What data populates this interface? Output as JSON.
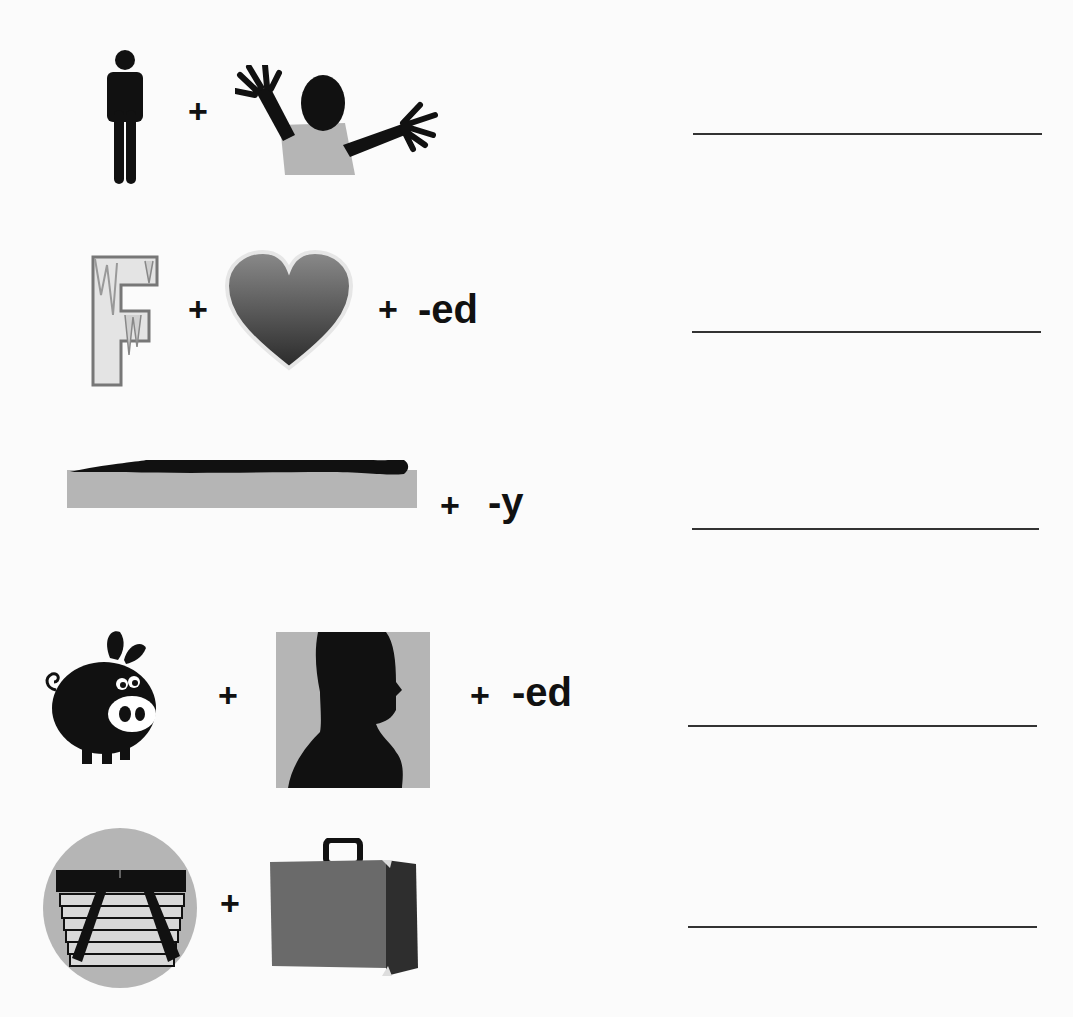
{
  "worksheet": {
    "rows": [
      {
        "pictures": [
          "man-icon",
          "child-waving-icon"
        ],
        "operators": [
          "+"
        ],
        "suffix": "",
        "answer": ""
      },
      {
        "pictures": [
          "frozen-letter-f-icon",
          "heart-icon"
        ],
        "operators": [
          "+",
          "+"
        ],
        "suffix": "-ed",
        "answer": ""
      },
      {
        "pictures": [
          "person-lying-down-icon"
        ],
        "operators": [
          "+"
        ],
        "suffix": "-y",
        "answer": ""
      },
      {
        "pictures": [
          "pig-icon",
          "head-silhouette-icon"
        ],
        "operators": [
          "+",
          "+"
        ],
        "suffix": "-ed",
        "answer": ""
      },
      {
        "pictures": [
          "picnic-basket-icon",
          "suitcase-icon"
        ],
        "operators": [
          "+"
        ],
        "suffix": "",
        "answer": ""
      }
    ]
  },
  "colors": {
    "ink": "#111111",
    "gray_fill": "#b5b5b5",
    "line": "#333333",
    "background": "#fbfbfb"
  }
}
